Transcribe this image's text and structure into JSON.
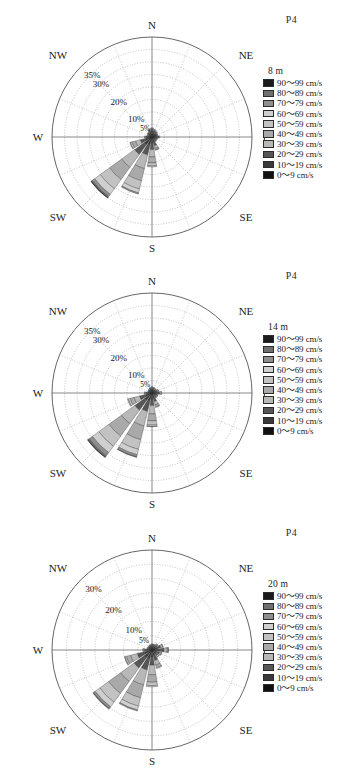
{
  "figure": {
    "station_label": "P4",
    "background": "#ffffff",
    "panel_count": 3
  },
  "speed_bins": [
    {
      "label": "90～99 cm/s",
      "color": "#1b1b1b"
    },
    {
      "label": "80～89 cm/s",
      "color": "#6f6f6f"
    },
    {
      "label": "70～79 cm/s",
      "color": "#8e8e8e"
    },
    {
      "label": "60～69 cm/s",
      "color": "#cfcfcf"
    },
    {
      "label": "50～59 cm/s",
      "color": "#c2c2c2"
    },
    {
      "label": "40～49 cm/s",
      "color": "#a9a9a9"
    },
    {
      "label": "30～39 cm/s",
      "color": "#b8b8b8"
    },
    {
      "label": "20～29 cm/s",
      "color": "#565656"
    },
    {
      "label": "10～19 cm/s",
      "color": "#3a3a3a"
    },
    {
      "label": "0～9 cm/s",
      "color": "#111111"
    }
  ],
  "compass": {
    "n": "N",
    "ne": "NE",
    "e": "E",
    "se": "SE",
    "s": "S",
    "sw": "SW",
    "w": "W",
    "nw": "NW"
  },
  "chart_data": [
    {
      "type": "pie",
      "subtype": "wind-rose",
      "title": "8 m",
      "depth": "8 m",
      "station": "P4",
      "legend_position": "right",
      "grid": true,
      "ring_labels": [
        "35%",
        "30%",
        "20%",
        "10%",
        "5%",
        "1%"
      ],
      "ring_values": [
        35,
        30,
        20,
        10,
        5,
        1
      ],
      "rmax": 40,
      "sector_count": 16,
      "spoke_count": 16,
      "ring_count": 8,
      "directions": [
        "N",
        "NNE",
        "NE",
        "ENE",
        "E",
        "ESE",
        "SE",
        "SSE",
        "S",
        "SSW",
        "SW",
        "WSW",
        "W",
        "WNW",
        "NW",
        "NNW"
      ],
      "series": [
        {
          "name": "0～9 cm/s",
          "values": [
            1.2,
            1.0,
            0.9,
            0.8,
            0.9,
            0.7,
            0.7,
            0.9,
            1.0,
            1.1,
            1.2,
            1.0,
            0.8,
            0.7,
            0.8,
            1.0
          ]
        },
        {
          "name": "10～19 cm/s",
          "values": [
            1.3,
            1.1,
            1.0,
            0.9,
            1.1,
            0.8,
            0.8,
            1.3,
            1.6,
            2.2,
            2.6,
            1.7,
            0.9,
            0.7,
            0.8,
            1.1
          ]
        },
        {
          "name": "20～29 cm/s",
          "values": [
            0.9,
            0.8,
            0.7,
            0.6,
            0.8,
            0.6,
            0.6,
            1.4,
            2.4,
            4.1,
            4.8,
            2.1,
            0.7,
            0.5,
            0.6,
            0.8
          ]
        },
        {
          "name": "30～39 cm/s",
          "values": [
            0.3,
            0.3,
            0.2,
            0.2,
            0.3,
            0.2,
            0.2,
            1.1,
            3.0,
            5.6,
            6.4,
            2.0,
            0.4,
            0.2,
            0.2,
            0.3
          ]
        },
        {
          "name": "40～49 cm/s",
          "values": [
            0.0,
            0.0,
            0.0,
            0.0,
            0.0,
            0.0,
            0.0,
            0.6,
            2.4,
            5.0,
            6.0,
            1.4,
            0.1,
            0.0,
            0.0,
            0.0
          ]
        },
        {
          "name": "50～59 cm/s",
          "values": [
            0.0,
            0.0,
            0.0,
            0.0,
            0.0,
            0.0,
            0.0,
            0.2,
            1.2,
            3.4,
            4.6,
            0.7,
            0.0,
            0.0,
            0.0,
            0.0
          ]
        },
        {
          "name": "60～69 cm/s",
          "values": [
            0.0,
            0.0,
            0.0,
            0.0,
            0.0,
            0.0,
            0.0,
            0.0,
            0.4,
            1.6,
            2.8,
            0.2,
            0.0,
            0.0,
            0.0,
            0.0
          ]
        },
        {
          "name": "70～79 cm/s",
          "values": [
            0.0,
            0.0,
            0.0,
            0.0,
            0.0,
            0.0,
            0.0,
            0.0,
            0.0,
            0.5,
            1.2,
            0.0,
            0.0,
            0.0,
            0.0,
            0.0
          ]
        },
        {
          "name": "80～89 cm/s",
          "values": [
            0.0,
            0.0,
            0.0,
            0.0,
            0.0,
            0.0,
            0.0,
            0.0,
            0.0,
            0.0,
            0.4,
            0.0,
            0.0,
            0.0,
            0.0,
            0.0
          ]
        },
        {
          "name": "90～99 cm/s",
          "values": [
            0.0,
            0.0,
            0.0,
            0.0,
            0.0,
            0.0,
            0.0,
            0.0,
            0.0,
            0.0,
            0.2,
            0.0,
            0.0,
            0.0,
            0.0,
            0.0
          ]
        }
      ]
    },
    {
      "type": "pie",
      "subtype": "wind-rose",
      "title": "14 m",
      "depth": "14 m",
      "station": "P4",
      "legend_position": "right",
      "grid": true,
      "ring_labels": [
        "35%",
        "30%",
        "20%",
        "10%",
        "5%",
        "1%"
      ],
      "ring_values": [
        35,
        30,
        20,
        10,
        5,
        1
      ],
      "rmax": 40,
      "sector_count": 16,
      "spoke_count": 16,
      "ring_count": 8,
      "directions": [
        "N",
        "NNE",
        "NE",
        "ENE",
        "E",
        "ESE",
        "SE",
        "SSE",
        "S",
        "SSW",
        "SW",
        "WSW",
        "W",
        "WNW",
        "NW",
        "NNW"
      ],
      "series": [
        {
          "name": "0～9 cm/s",
          "values": [
            0.8,
            0.7,
            0.6,
            0.6,
            0.8,
            0.6,
            0.6,
            0.7,
            0.8,
            0.9,
            1.0,
            0.9,
            0.7,
            0.6,
            0.6,
            0.7
          ]
        },
        {
          "name": "10～19 cm/s",
          "values": [
            0.9,
            0.8,
            0.8,
            0.9,
            1.2,
            0.8,
            0.8,
            1.2,
            1.6,
            2.3,
            2.6,
            1.8,
            1.0,
            0.6,
            0.7,
            0.8
          ]
        },
        {
          "name": "20～29 cm/s",
          "values": [
            0.6,
            0.6,
            0.6,
            0.8,
            1.1,
            0.7,
            0.7,
            1.6,
            2.6,
            4.4,
            4.9,
            2.4,
            0.8,
            0.4,
            0.5,
            0.6
          ]
        },
        {
          "name": "30～39 cm/s",
          "values": [
            0.2,
            0.2,
            0.2,
            0.4,
            0.6,
            0.3,
            0.3,
            1.4,
            3.4,
            6.0,
            6.6,
            2.3,
            0.4,
            0.2,
            0.2,
            0.2
          ]
        },
        {
          "name": "40～49 cm/s",
          "values": [
            0.0,
            0.0,
            0.0,
            0.1,
            0.2,
            0.1,
            0.1,
            0.8,
            2.8,
            5.6,
            6.2,
            1.6,
            0.1,
            0.0,
            0.0,
            0.0
          ]
        },
        {
          "name": "50～59 cm/s",
          "values": [
            0.0,
            0.0,
            0.0,
            0.0,
            0.0,
            0.0,
            0.0,
            0.3,
            1.6,
            4.0,
            5.0,
            0.8,
            0.0,
            0.0,
            0.0,
            0.0
          ]
        },
        {
          "name": "60～69 cm/s",
          "values": [
            0.0,
            0.0,
            0.0,
            0.0,
            0.0,
            0.0,
            0.0,
            0.0,
            0.6,
            2.2,
            3.2,
            0.3,
            0.0,
            0.0,
            0.0,
            0.0
          ]
        },
        {
          "name": "70～79 cm/s",
          "values": [
            0.0,
            0.0,
            0.0,
            0.0,
            0.0,
            0.0,
            0.0,
            0.0,
            0.1,
            0.9,
            1.6,
            0.0,
            0.0,
            0.0,
            0.0,
            0.0
          ]
        },
        {
          "name": "80～89 cm/s",
          "values": [
            0.0,
            0.0,
            0.0,
            0.0,
            0.0,
            0.0,
            0.0,
            0.0,
            0.0,
            0.2,
            0.6,
            0.0,
            0.0,
            0.0,
            0.0,
            0.0
          ]
        },
        {
          "name": "90～99 cm/s",
          "values": [
            0.0,
            0.0,
            0.0,
            0.0,
            0.0,
            0.0,
            0.0,
            0.0,
            0.0,
            0.0,
            0.2,
            0.0,
            0.0,
            0.0,
            0.0,
            0.0
          ]
        }
      ]
    },
    {
      "type": "pie",
      "subtype": "wind-rose",
      "title": "20 m",
      "depth": "20 m",
      "station": "P4",
      "legend_position": "right",
      "grid": true,
      "ring_labels": [
        "30%",
        "20%",
        "10%",
        "5%",
        "1%"
      ],
      "ring_values": [
        30,
        20,
        10,
        5,
        1
      ],
      "rmax": 35,
      "sector_count": 16,
      "spoke_count": 16,
      "ring_count": 7,
      "directions": [
        "N",
        "NNE",
        "NE",
        "ENE",
        "E",
        "ESE",
        "SE",
        "SSE",
        "S",
        "SSW",
        "SW",
        "WSW",
        "W",
        "WNW",
        "NW",
        "NNW"
      ],
      "series": [
        {
          "name": "0～9 cm/s",
          "values": [
            0.7,
            0.6,
            0.6,
            0.7,
            0.9,
            0.7,
            0.6,
            0.7,
            0.8,
            0.8,
            0.9,
            0.8,
            0.7,
            0.6,
            0.6,
            0.6
          ]
        },
        {
          "name": "10～19 cm/s",
          "values": [
            0.8,
            0.8,
            0.9,
            1.2,
            1.5,
            1.0,
            0.9,
            1.3,
            1.7,
            2.2,
            2.4,
            1.9,
            1.1,
            0.7,
            0.7,
            0.7
          ]
        },
        {
          "name": "20～29 cm/s",
          "values": [
            0.5,
            0.6,
            0.8,
            1.3,
            1.8,
            1.1,
            1.0,
            1.8,
            2.8,
            4.2,
            4.5,
            2.6,
            0.9,
            0.4,
            0.4,
            0.5
          ]
        },
        {
          "name": "30～39 cm/s",
          "values": [
            0.1,
            0.2,
            0.3,
            0.7,
            1.1,
            0.6,
            0.5,
            1.6,
            3.4,
            5.4,
            5.8,
            2.4,
            0.4,
            0.1,
            0.1,
            0.1
          ]
        },
        {
          "name": "40～49 cm/s",
          "values": [
            0.0,
            0.0,
            0.1,
            0.2,
            0.4,
            0.2,
            0.2,
            1.0,
            2.6,
            4.6,
            5.2,
            1.5,
            0.1,
            0.0,
            0.0,
            0.0
          ]
        },
        {
          "name": "50～59 cm/s",
          "values": [
            0.0,
            0.0,
            0.0,
            0.0,
            0.1,
            0.0,
            0.0,
            0.3,
            1.2,
            3.0,
            3.8,
            0.6,
            0.0,
            0.0,
            0.0,
            0.0
          ]
        },
        {
          "name": "60～69 cm/s",
          "values": [
            0.0,
            0.0,
            0.0,
            0.0,
            0.0,
            0.0,
            0.0,
            0.0,
            0.4,
            1.4,
            2.0,
            0.1,
            0.0,
            0.0,
            0.0,
            0.0
          ]
        },
        {
          "name": "70～79 cm/s",
          "values": [
            0.0,
            0.0,
            0.0,
            0.0,
            0.0,
            0.0,
            0.0,
            0.0,
            0.0,
            0.4,
            0.8,
            0.0,
            0.0,
            0.0,
            0.0,
            0.0
          ]
        },
        {
          "name": "80～89 cm/s",
          "values": [
            0.0,
            0.0,
            0.0,
            0.0,
            0.0,
            0.0,
            0.0,
            0.0,
            0.0,
            0.0,
            0.2,
            0.0,
            0.0,
            0.0,
            0.0,
            0.0
          ]
        },
        {
          "name": "90～99 cm/s",
          "values": [
            0.0,
            0.0,
            0.0,
            0.0,
            0.0,
            0.0,
            0.0,
            0.0,
            0.0,
            0.0,
            0.0,
            0.0,
            0.0,
            0.0,
            0.0,
            0.0
          ]
        }
      ]
    }
  ]
}
